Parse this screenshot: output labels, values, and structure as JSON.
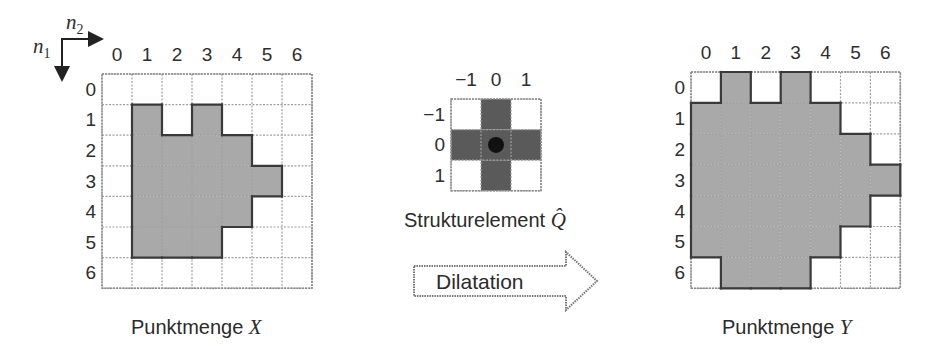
{
  "axes_indicator": {
    "horizontal_label": "n2",
    "vertical_label": "n1",
    "horizontal_base": "n",
    "horizontal_sub": "2",
    "vertical_base": "n",
    "vertical_sub": "1"
  },
  "left_grid": {
    "caption_text": "Punktmenge ",
    "caption_symbol": "X",
    "col_labels": [
      "0",
      "1",
      "2",
      "3",
      "4",
      "5",
      "6"
    ],
    "row_labels": [
      "0",
      "1",
      "2",
      "3",
      "4",
      "5",
      "6"
    ],
    "filled_cells": [
      [
        1,
        1
      ],
      [
        1,
        3
      ],
      [
        2,
        1
      ],
      [
        2,
        2
      ],
      [
        2,
        3
      ],
      [
        2,
        4
      ],
      [
        3,
        1
      ],
      [
        3,
        2
      ],
      [
        3,
        3
      ],
      [
        3,
        4
      ],
      [
        3,
        5
      ],
      [
        4,
        1
      ],
      [
        4,
        2
      ],
      [
        4,
        3
      ],
      [
        4,
        4
      ],
      [
        5,
        1
      ],
      [
        5,
        2
      ],
      [
        5,
        3
      ]
    ]
  },
  "structuring_element": {
    "caption_text": "Strukturelement ",
    "caption_symbol": "Q̂",
    "col_labels": [
      "−1",
      "0",
      "1"
    ],
    "row_labels": [
      "−1",
      "0",
      "1"
    ],
    "filled_cells": [
      [
        -1,
        0
      ],
      [
        0,
        -1
      ],
      [
        0,
        0
      ],
      [
        0,
        1
      ],
      [
        1,
        0
      ]
    ],
    "origin_marker": [
      0,
      0
    ]
  },
  "operation_arrow": {
    "label": "Dilatation"
  },
  "right_grid": {
    "caption_text": "Punktmenge ",
    "caption_symbol": "Y",
    "col_labels": [
      "0",
      "1",
      "2",
      "3",
      "4",
      "5",
      "6"
    ],
    "row_labels": [
      "0",
      "1",
      "2",
      "3",
      "4",
      "5",
      "6"
    ],
    "filled_cells": [
      [
        0,
        1
      ],
      [
        0,
        3
      ],
      [
        1,
        0
      ],
      [
        1,
        1
      ],
      [
        1,
        2
      ],
      [
        1,
        3
      ],
      [
        1,
        4
      ],
      [
        2,
        0
      ],
      [
        2,
        1
      ],
      [
        2,
        2
      ],
      [
        2,
        3
      ],
      [
        2,
        4
      ],
      [
        2,
        5
      ],
      [
        3,
        0
      ],
      [
        3,
        1
      ],
      [
        3,
        2
      ],
      [
        3,
        3
      ],
      [
        3,
        4
      ],
      [
        3,
        5
      ],
      [
        3,
        6
      ],
      [
        4,
        0
      ],
      [
        4,
        1
      ],
      [
        4,
        2
      ],
      [
        4,
        3
      ],
      [
        4,
        4
      ],
      [
        4,
        5
      ],
      [
        5,
        0
      ],
      [
        5,
        1
      ],
      [
        5,
        2
      ],
      [
        5,
        3
      ],
      [
        5,
        4
      ],
      [
        6,
        1
      ],
      [
        6,
        2
      ],
      [
        6,
        3
      ]
    ]
  },
  "colors": {
    "set_fill": "#a9a9a9",
    "set_outline": "#3a3a3a",
    "struct_fill": "#5a5a5a",
    "origin_dot": "#111111",
    "grid_line": "#a0a0a0",
    "text": "#2e2e2e"
  }
}
